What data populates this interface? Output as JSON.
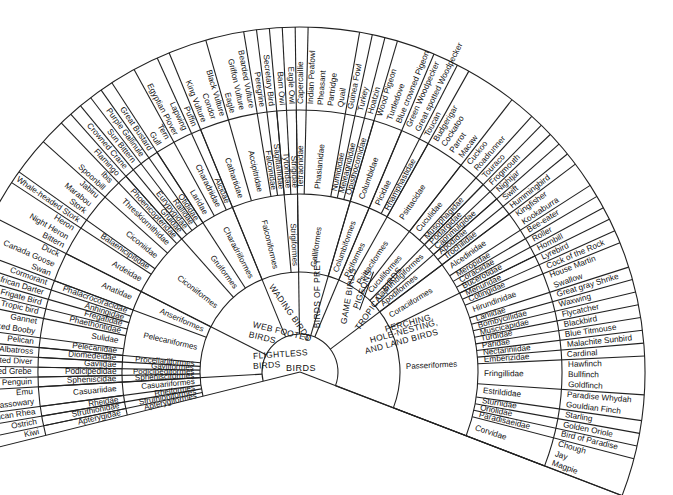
{
  "diagram": {
    "root": "BIRDS",
    "groups": [
      {
        "label": "FLIGHTLESS BIRDS",
        "orders": [
          {
            "name": "Apterygiformes",
            "families": [
              {
                "name": "Apterygidae",
                "species": [
                  "Kiwi"
                ]
              }
            ]
          },
          {
            "name": "Struthioniformes",
            "families": [
              {
                "name": "Struthionidae",
                "species": [
                  "Ostrich"
                ]
              }
            ]
          },
          {
            "name": "Rheiformes",
            "families": [
              {
                "name": "Rheidae",
                "species": [
                  "American Rhea"
                ]
              }
            ]
          },
          {
            "name": "Casuariiformes",
            "families": [
              {
                "name": "Casuariidae",
                "species": [
                  "Australian Cassowary",
                  "Emu"
                ]
              }
            ]
          }
        ]
      },
      {
        "label": "WEB FOOTED BIRDS",
        "orders": [
          {
            "name": "Sphenisciformes",
            "families": [
              {
                "name": "Spheniscidae",
                "species": [
                  "Jackass Penguin"
                ]
              }
            ]
          },
          {
            "name": "Podicipediformes",
            "families": [
              {
                "name": "Podicipedidae",
                "species": [
                  "Great crested Grebe"
                ]
              }
            ]
          },
          {
            "name": "Gaviiformes",
            "families": [
              {
                "name": "Gaviidae",
                "species": [
                  "Red Throated Diver"
                ]
              }
            ]
          },
          {
            "name": "Procellariiformes",
            "families": [
              {
                "name": "Diomedeidae",
                "species": [
                  "Albatross"
                ]
              }
            ]
          },
          {
            "name": "Pelecaniformes",
            "families": [
              {
                "name": "Pelecanidae",
                "species": [
                  "Pelican"
                ]
              },
              {
                "name": "Sulidae",
                "species": [
                  "Masked Booby",
                  "Gannet"
                ]
              },
              {
                "name": "Phaethontidae",
                "species": [
                  "Tropic bird"
                ]
              },
              {
                "name": "Fregatidae",
                "species": [
                  "Frigate Bird"
                ]
              },
              {
                "name": "Anhingidae",
                "species": [
                  "African Darter"
                ]
              },
              {
                "name": "Phalacrocoracidae",
                "species": [
                  "Cormorant"
                ]
              }
            ]
          },
          {
            "name": "Anseriformes",
            "families": [
              {
                "name": "Anatidae",
                "species": [
                  "Swan",
                  "Canada Goose",
                  "Duck"
                ]
              }
            ]
          }
        ]
      },
      {
        "label": "WADING BIRDS",
        "orders": [
          {
            "name": "Ciconiiformes",
            "families": [
              {
                "name": "Ardeidae",
                "species": [
                  "Bittern",
                  "Night Heron",
                  "Heron"
                ]
              },
              {
                "name": "Balaenicipitidae",
                "species": [
                  "Whale-headed Stork"
                ]
              },
              {
                "name": "Ciconiidae",
                "species": [
                  "Stork",
                  "Marabou",
                  "Jabiru"
                ]
              },
              {
                "name": "Threskiornithidae",
                "species": [
                  "Spoonbill",
                  "Ibis"
                ]
              },
              {
                "name": "Phoenicopteridae",
                "species": [
                  "Flamingo"
                ]
              }
            ]
          },
          {
            "name": "Gruiformes",
            "families": [
              {
                "name": "Gruidae",
                "species": [
                  "Crowned Crane"
                ]
              },
              {
                "name": "Eurypygidae",
                "species": [
                  "Sun Bittern"
                ]
              },
              {
                "name": "Rallidae",
                "species": [
                  "Purple Gallinule"
                ]
              },
              {
                "name": "Otididae",
                "species": [
                  "Great Bustard"
                ]
              }
            ]
          },
          {
            "name": "Charadriiformes",
            "families": [
              {
                "name": "Laridae",
                "species": [
                  "Gull",
                  "Tern"
                ]
              },
              {
                "name": "Charadriidae",
                "species": [
                  "Egyptian Plover",
                  "Lapwing"
                ]
              },
              {
                "name": "Alcidae",
                "species": [
                  "Puffin"
                ]
              }
            ]
          }
        ]
      },
      {
        "label": "BIRDS OF PREY",
        "orders": [
          {
            "name": "Falconiformes",
            "families": [
              {
                "name": "Cathartidae",
                "species": [
                  "King Vulture",
                  "Condor",
                  "Black Vulture"
                ]
              },
              {
                "name": "Accipitridae",
                "species": [
                  "Eagle",
                  "Griffon Vulture",
                  "Bearded Vulture"
                ]
              },
              {
                "name": "Falconidae",
                "species": [
                  "Peregrine"
                ]
              },
              {
                "name": "Sagittariidae",
                "species": [
                  "Secretary Bird"
                ]
              }
            ]
          },
          {
            "name": "Strigiformes",
            "families": [
              {
                "name": "Tytonidae",
                "species": [
                  "Barn Owl"
                ]
              },
              {
                "name": "Strigidae",
                "species": [
                  "Eagle Owl"
                ]
              }
            ]
          }
        ]
      },
      {
        "label": "GAME BIRDS",
        "orders": [
          {
            "name": "Galliformes",
            "families": [
              {
                "name": "Tetraonidae",
                "species": [
                  "Capercaillie"
                ]
              },
              {
                "name": "Phasianidae",
                "species": [
                  "Indian Peafowl",
                  "Pheasant",
                  "Partridge",
                  "Quail"
                ]
              },
              {
                "name": "Numididae",
                "species": [
                  "Guinea Fowl"
                ]
              },
              {
                "name": "Meleagrididae",
                "species": [
                  "Turkey"
                ]
              },
              {
                "name": "Opisthocomidae",
                "species": [
                  "Hoatzin"
                ]
              }
            ]
          }
        ]
      },
      {
        "label": "PIGEONS",
        "orders": [
          {
            "name": "Columbiformes",
            "families": [
              {
                "name": "Columbidae",
                "species": [
                  "Wood Pigeon",
                  "Turtledove",
                  "Blue crowned Pigeon"
                ]
              }
            ]
          }
        ]
      },
      {
        "label": "TROPICAL BIRDS",
        "orders": [
          {
            "name": "Piciformes",
            "families": [
              {
                "name": "Picidae",
                "species": [
                  "Green Woodpecker",
                  "Great spotted Woodpecker"
                ]
              },
              {
                "name": "Rhamphastidae",
                "species": [
                  "Toucan"
                ]
              }
            ]
          },
          {
            "name": "Psittaciformes",
            "families": [
              {
                "name": "Psittacidae",
                "species": [
                  "Budgerigar",
                  "Cockatoo",
                  "Parrot",
                  "Macaw"
                ]
              }
            ]
          },
          {
            "name": "Cuculiformes",
            "families": [
              {
                "name": "Cuculidae",
                "species": [
                  "Cuckoo",
                  "Roadrunner"
                ]
              },
              {
                "name": "Musophagidae",
                "species": [
                  "Touraco"
                ]
              }
            ]
          },
          {
            "name": "Caprimulgiformes",
            "families": [
              {
                "name": "Podargidae",
                "species": [
                  "Frogmouth"
                ]
              },
              {
                "name": "Caprimulgidae",
                "species": [
                  "Nightjar"
                ]
              }
            ]
          },
          {
            "name": "Apodiformes",
            "families": [
              {
                "name": "Apodidae",
                "species": [
                  "Swift"
                ]
              },
              {
                "name": "Trochilidae",
                "species": [
                  "Hummingbird"
                ]
              }
            ]
          }
        ]
      },
      {
        "label": "PERCHING, HOLE-NESTING, AND LAND BIRDS",
        "orders": [
          {
            "name": "Coraciiformes",
            "families": [
              {
                "name": "Alcedinidae",
                "species": [
                  "Kingfisher",
                  "Kookaburra"
                ]
              },
              {
                "name": "Meropidae",
                "species": [
                  "Bee-eater"
                ]
              },
              {
                "name": "Coraciidae",
                "species": [
                  "Roller"
                ]
              },
              {
                "name": "Bucerotidae",
                "species": [
                  "Hornbill"
                ]
              }
            ]
          },
          {
            "name": "Passeriformes",
            "families": [
              {
                "name": "Menuridae",
                "species": [
                  "Lyrebird"
                ]
              },
              {
                "name": "Cotingidae",
                "species": [
                  "Cock of the Rock"
                ]
              },
              {
                "name": "Hirundinidae",
                "species": [
                  "House Martin",
                  "Swallow"
                ]
              },
              {
                "name": "Laniidae",
                "species": [
                  "Great gray Shrike"
                ]
              },
              {
                "name": "Bombycillidae",
                "species": [
                  "Waxwing"
                ]
              },
              {
                "name": "Muscicapidae",
                "species": [
                  "Flycatcher"
                ]
              },
              {
                "name": "Turdidae",
                "species": [
                  "Blackbird"
                ]
              },
              {
                "name": "Paridae",
                "species": [
                  "Blue Titmouse"
                ]
              },
              {
                "name": "Nectariniidae",
                "species": [
                  "Malachite Sunbird"
                ]
              },
              {
                "name": "Emberizidae",
                "species": [
                  "Cardinal"
                ]
              },
              {
                "name": "Fringillidae",
                "species": [
                  "Hawfinch",
                  "Bullfinch",
                  "Goldfinch"
                ]
              },
              {
                "name": "Estrildidae",
                "species": [
                  "Paradise Whydah",
                  "Gouldian Finch"
                ]
              },
              {
                "name": "Sturnidae",
                "species": [
                  "Starling"
                ]
              },
              {
                "name": "Oriolidae",
                "species": [
                  "Golden Oriole"
                ]
              },
              {
                "name": "Paradisaeidae",
                "species": [
                  "Bird of Paradise"
                ]
              },
              {
                "name": "Corvidae",
                "species": [
                  "Chough",
                  "Jay",
                  "Magpie"
                ]
              }
            ]
          }
        ]
      }
    ]
  },
  "labels": {
    "root": "BIRDS",
    "groups": {
      "flightless": [
        "FLIGHTLESS",
        "BIRDS"
      ],
      "webfooted": [
        "WEB FOOTED",
        "BIRDS"
      ],
      "wading": "WADING BIRDS",
      "prey": "BIRDS OF PREY",
      "game": "GAME BIRDS",
      "pigeons": "PIGEONS",
      "tropical": "TROPICAL BIRDS",
      "perching": [
        "PERCHING,",
        "HOLE-NESTING,",
        "AND LAND BIRDS"
      ]
    }
  }
}
